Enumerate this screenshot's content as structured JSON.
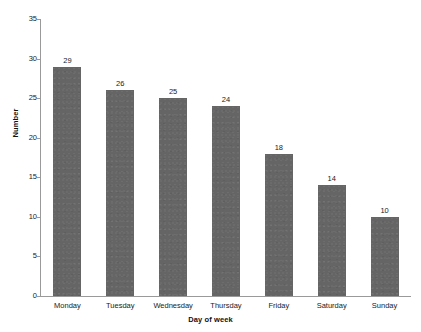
{
  "chart_data": {
    "type": "bar",
    "title": "",
    "subtitle": "",
    "xlabel": "Day of week",
    "ylabel": "Number",
    "categories": [
      "Monday",
      "Tuesday",
      "Wednesday",
      "Thursday",
      "Friday",
      "Saturday",
      "Sunday"
    ],
    "values": [
      29,
      26,
      25,
      24,
      18,
      14,
      10
    ],
    "data_labels": [
      "29",
      "26",
      "25",
      "24",
      "18",
      "14",
      "10"
    ],
    "ylim": [
      0,
      35
    ],
    "y_ticks": [
      0,
      5,
      10,
      15,
      20,
      25,
      30,
      35
    ],
    "y_tick_labels": [
      "0",
      "5",
      "10",
      "15",
      "20",
      "25",
      "30",
      "35"
    ],
    "grid": false,
    "legend": false,
    "legend_position": "none",
    "bar_color": "#656565",
    "axis_color": "#9a9a9a",
    "text_color": "#1a1a1a",
    "background_color": "#ffffff"
  }
}
